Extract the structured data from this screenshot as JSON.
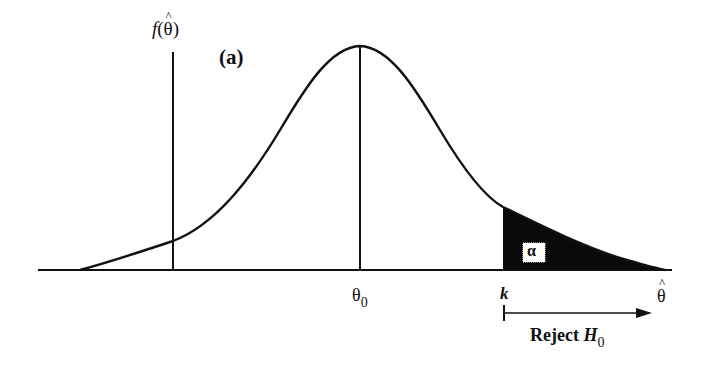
{
  "diagram": {
    "panel_label": "(a)",
    "y_axis_label": {
      "func": "f",
      "open": "(",
      "var": "θ",
      "hat": "^",
      "close": ")"
    },
    "x_axis_label": {
      "var": "θ",
      "hat": "^"
    },
    "center_label": {
      "var": "θ",
      "sub": "0"
    },
    "critical_label": "k",
    "region_label": "α",
    "reject_label": {
      "text": "Reject ",
      "var": "H",
      "sub": "0"
    },
    "colors": {
      "ink": "#111111",
      "background": "#ffffff",
      "shade": "#0a0a0a"
    }
  }
}
